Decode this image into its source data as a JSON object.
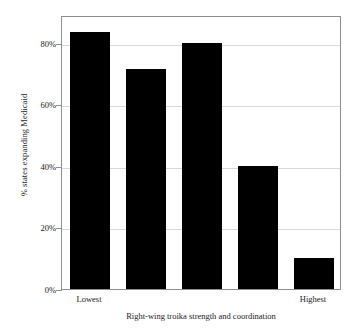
{
  "chart_data": {
    "type": "bar",
    "title": "",
    "subtitle": "",
    "xlabel": "Right-wing troika strength and coordination",
    "ylabel": "% states expanding Medicaid",
    "categories": [
      "Lowest",
      "2",
      "3",
      "4",
      "Highest"
    ],
    "category_tick_labels": [
      "Lowest",
      "",
      "",
      "",
      "Highest"
    ],
    "values": [
      83.5,
      71.5,
      80,
      40,
      10
    ],
    "value_labels": [
      "",
      "",
      "",
      "",
      ""
    ],
    "ylim": [
      0,
      89
    ],
    "yticks": [
      0,
      20,
      40,
      60,
      80
    ],
    "ytick_labels": [
      "0%",
      "20%",
      "40%",
      "60%",
      "80%"
    ],
    "grid": "horizontal",
    "legend": "none",
    "bar_color": "#000000",
    "gridline_color": "#d9d9d9",
    "axis_color": "#8e8e8e",
    "background_color": "#ffffff",
    "text_color": "#1a1a1a"
  }
}
